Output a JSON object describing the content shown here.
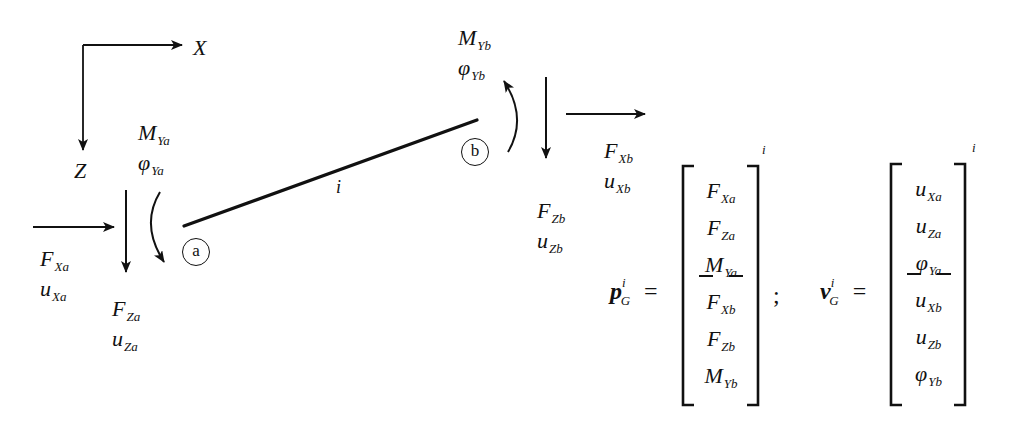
{
  "axes": {
    "x_label": "X",
    "z_label": "Z"
  },
  "member": {
    "label": "i",
    "end_a": {
      "node_label": "a"
    },
    "end_b": {
      "node_label": "b"
    }
  },
  "end_a_labels": {
    "moment": {
      "main": "M",
      "sub": "Ya"
    },
    "rotation": {
      "main": "φ",
      "sub": "Ya"
    },
    "force_x": {
      "main": "F",
      "sub": "Xa"
    },
    "disp_x": {
      "main": "u",
      "sub": "Xa"
    },
    "force_z": {
      "main": "F",
      "sub": "Za"
    },
    "disp_z": {
      "main": "u",
      "sub": "Za"
    }
  },
  "end_b_labels": {
    "moment": {
      "main": "M",
      "sub": "Yb"
    },
    "rotation": {
      "main": "φ",
      "sub": "Yb"
    },
    "force_x": {
      "main": "F",
      "sub": "Xb"
    },
    "disp_x": {
      "main": "u",
      "sub": "Xb"
    },
    "force_z": {
      "main": "F",
      "sub": "Zb"
    },
    "disp_z": {
      "main": "u",
      "sub": "Zb"
    }
  },
  "force_vector": {
    "symbol": "p",
    "sup": "i",
    "sub": "G",
    "equals": "=",
    "separator": ";",
    "bracket_sup": "i",
    "entries": [
      {
        "main": "F",
        "sub": "Xa"
      },
      {
        "main": "F",
        "sub": "Za"
      },
      {
        "main": "M",
        "sub": "Ya"
      },
      {
        "main": "F",
        "sub": "Xb"
      },
      {
        "main": "F",
        "sub": "Zb"
      },
      {
        "main": "M",
        "sub": "Yb"
      }
    ]
  },
  "displacement_vector": {
    "symbol": "v",
    "sup": "i",
    "sub": "G",
    "equals": "=",
    "bracket_sup": "i",
    "entries": [
      {
        "main": "u",
        "sub": "Xa"
      },
      {
        "main": "u",
        "sub": "Za"
      },
      {
        "main": "φ",
        "sub": "Ya"
      },
      {
        "main": "u",
        "sub": "Xb"
      },
      {
        "main": "u",
        "sub": "Zb"
      },
      {
        "main": "φ",
        "sub": "Yb"
      }
    ]
  }
}
